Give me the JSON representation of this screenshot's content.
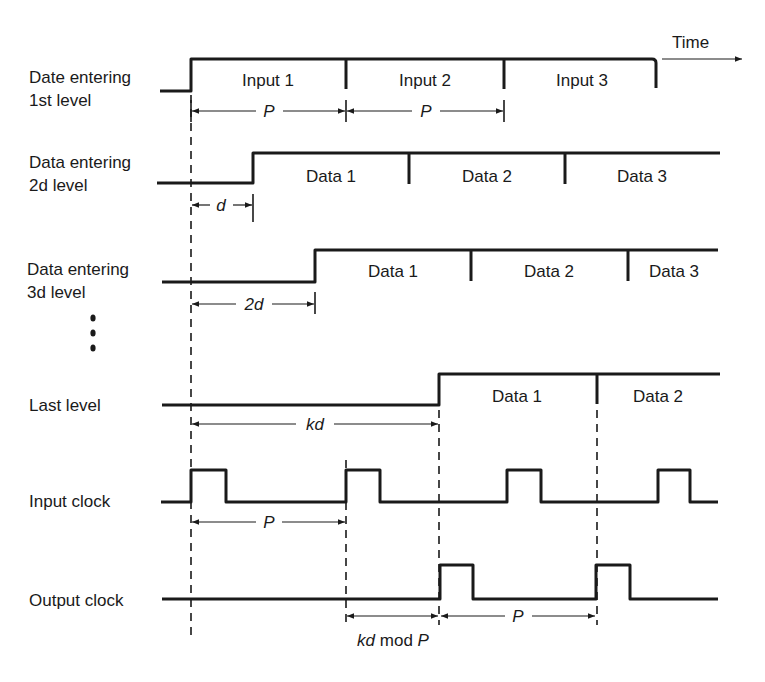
{
  "diagram": {
    "type": "timing-diagram",
    "time_axis_label": "Time",
    "signals": [
      {
        "id": "level1",
        "label_line1": "Date entering",
        "label_line2": "1st level",
        "segments": [
          "Input 1",
          "Input 2",
          "Input 3"
        ]
      },
      {
        "id": "level2",
        "label_line1": "Data entering",
        "label_line2": "2d level",
        "segments": [
          "Data 1",
          "Data 2",
          "Data 3"
        ]
      },
      {
        "id": "level3",
        "label_line1": "Data entering",
        "label_line2": "3d level",
        "segments": [
          "Data 1",
          "Data 2",
          "Data 3"
        ]
      },
      {
        "id": "last",
        "label_line1": "Last level",
        "segments": [
          "Data 1",
          "Data 2"
        ]
      },
      {
        "id": "input_clock",
        "label_line1": "Input clock"
      },
      {
        "id": "output_clock",
        "label_line1": "Output clock"
      }
    ],
    "continuation_marker": "⋮",
    "dimensions": {
      "level1_p1": "P",
      "level1_p2": "P",
      "level2_d": "d",
      "level3_2d": "2d",
      "last_kd": "kd",
      "input_clock_p": "P",
      "output_clock_kd": "kd",
      "output_clock_mod": " mod ",
      "output_clock_p_label": "P",
      "output_clock_p": "P"
    }
  }
}
